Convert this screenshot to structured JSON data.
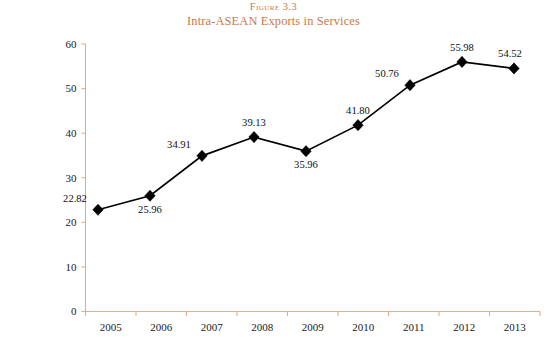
{
  "figure": {
    "number_label": "Figure 3.3",
    "title": "Intra-ASEAN Exports in Services"
  },
  "axes": {
    "ylabel": "US$ Billion",
    "xlabel": ""
  },
  "colors": {
    "title": "#c8784a",
    "axis": "#e9a98d",
    "series": "#000000",
    "background": "#ffffff"
  },
  "chart_data": {
    "type": "line",
    "title": "Intra-ASEAN Exports in Services",
    "subtitle": "Figure 3.3",
    "xlabel": "",
    "ylabel": "US$ Billion",
    "categories": [
      "2005",
      "2006",
      "2007",
      "2008",
      "2009",
      "2010",
      "2011",
      "2012",
      "2013"
    ],
    "values": [
      22.82,
      25.96,
      34.91,
      39.13,
      35.96,
      41.8,
      50.76,
      55.98,
      54.52
    ],
    "data_labels": [
      "22.82",
      "25.96",
      "34.91",
      "39.13",
      "35.96",
      "41.80",
      "50.76",
      "55.98",
      "54.52"
    ],
    "label_positions": [
      "above-left",
      "below",
      "above-left",
      "above",
      "below",
      "above",
      "above-left",
      "above",
      "above-right"
    ],
    "ylim": [
      0,
      60
    ],
    "yticks": [
      0,
      10,
      20,
      30,
      40,
      50,
      60
    ],
    "ytick_labels": [
      "0",
      "10",
      "20",
      "30",
      "40",
      "50",
      "60"
    ],
    "grid": false,
    "legend": false,
    "marker": "diamond",
    "series": [
      {
        "name": "Intra-ASEAN Exports in Services",
        "values": [
          22.82,
          25.96,
          34.91,
          39.13,
          35.96,
          41.8,
          50.76,
          55.98,
          54.52
        ]
      }
    ]
  }
}
